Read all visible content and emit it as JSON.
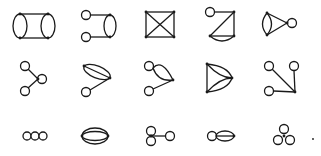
{
  "figure": {
    "rows": [
      {
        "label": "row-1",
        "graphs": [
          {
            "id": "g1",
            "name": "two-bubbles-joined-by-double-edge"
          },
          {
            "id": "g2",
            "name": "bubble-with-two-tadpoles"
          },
          {
            "id": "g3",
            "name": "square-with-diagonals"
          },
          {
            "id": "g4",
            "name": "triangle-with-tadpole-and-double-edge"
          },
          {
            "id": "g5",
            "name": "triangle-bubble-with-tadpole"
          }
        ]
      },
      {
        "label": "row-2",
        "graphs": [
          {
            "id": "g6",
            "name": "vertex-with-two-tadpoles"
          },
          {
            "id": "g7",
            "name": "triple-edge-with-tadpole"
          },
          {
            "id": "g8",
            "name": "bubble-with-two-tadpoles-side"
          },
          {
            "id": "g9",
            "name": "theta-triangle"
          },
          {
            "id": "g10",
            "name": "vertex-with-three-tadpoles"
          }
        ]
      },
      {
        "label": "row-3",
        "graphs": [
          {
            "id": "g11",
            "name": "three-chained-loops"
          },
          {
            "id": "g12",
            "name": "ellipse-with-inner-edge"
          },
          {
            "id": "g13",
            "name": "figure-eight-with-tadpole"
          },
          {
            "id": "g14",
            "name": "loop-and-double-bubble"
          },
          {
            "id": "g15",
            "name": "trefoil-three-loops"
          }
        ]
      }
    ],
    "trailing_mark": "."
  },
  "background_text": "faint bleed-through text (illegible)"
}
